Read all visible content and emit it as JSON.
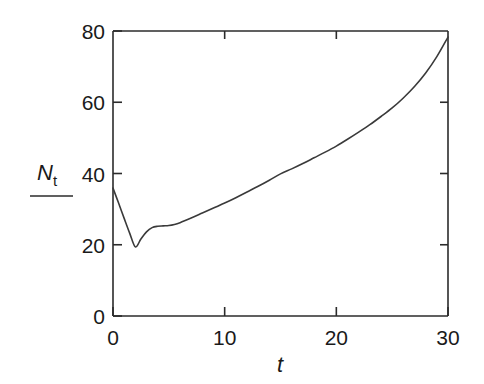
{
  "figure": {
    "background_color": "#ffffff",
    "line_color": "#3a3a3a",
    "axis_color": "#2b2b2b"
  },
  "axes": {
    "x_title": "t",
    "y_title_main": "N",
    "y_title_sub": "t",
    "x_ticks": [
      "0",
      "10",
      "20",
      "30"
    ],
    "y_ticks": [
      "0",
      "20",
      "40",
      "60",
      "80"
    ]
  },
  "chart_data": {
    "type": "line",
    "title": "",
    "xlabel": "t",
    "ylabel": "N_t",
    "xlim": [
      0,
      30
    ],
    "ylim": [
      0,
      80
    ],
    "xticks": [
      0,
      10,
      20,
      30
    ],
    "yticks": [
      0,
      20,
      40,
      60,
      80
    ],
    "grid": false,
    "legend": "none",
    "series": [
      {
        "name": "N_t",
        "x": [
          0,
          0.5,
          1.0,
          1.5,
          2.0,
          2.5,
          3.0,
          3.5,
          4.0,
          4.5,
          5.0,
          5.5,
          6.0,
          7.0,
          8.0,
          9.0,
          10.0,
          11.0,
          12.0,
          13.0,
          14.0,
          15.0,
          16.0,
          17.0,
          18.0,
          19.0,
          20.0,
          21.0,
          22.0,
          23.0,
          24.0,
          25.0,
          26.0,
          27.0,
          28.0,
          29.0,
          30.0
        ],
        "y": [
          35.9,
          31.7,
          27.4,
          23.2,
          19.4,
          21.6,
          23.6,
          24.8,
          25.2,
          25.3,
          25.4,
          25.7,
          26.2,
          27.5,
          28.9,
          30.3,
          31.7,
          33.2,
          34.8,
          36.4,
          38.1,
          39.9,
          41.3,
          42.8,
          44.4,
          46.0,
          47.7,
          49.6,
          51.6,
          53.7,
          56.0,
          58.4,
          61.2,
          64.4,
          68.2,
          72.8,
          78.3
        ]
      }
    ],
    "annotations": {
      "start_value": 35.9,
      "minimum": {
        "x": 2.0,
        "y": 19.4
      },
      "plateau": {
        "x_range": [
          3.8,
          5.5
        ],
        "y": 25.3
      },
      "end_value": 78.3
    }
  }
}
